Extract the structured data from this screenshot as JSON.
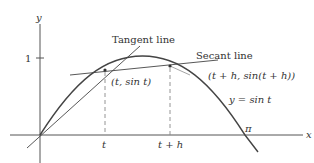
{
  "figure": {
    "type": "diagram",
    "colors": {
      "curve": "#444444",
      "axes": "#555555",
      "text": "#333333",
      "dashed": "#888888"
    }
  },
  "axes": {
    "x_label": "x",
    "y_label": "y",
    "y_tick_label": "1",
    "x_tick_labels": {
      "t": "t",
      "t_plus_h": "t + h",
      "pi": "π"
    }
  },
  "labels": {
    "tangent_line": "Tangent line",
    "secant_line": "Secant line",
    "point_t": "(t, sin t)",
    "point_t_plus_h": "(t + h, sin(t + h))",
    "curve": "y = sin t"
  }
}
